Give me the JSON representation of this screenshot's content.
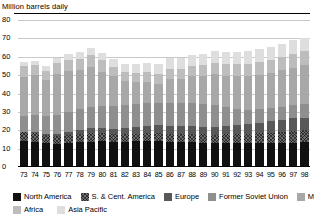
{
  "chart_data": {
    "type": "bar",
    "stacked": true,
    "title": "Million barrels daily",
    "xlabel": "",
    "ylabel": "Million barrels daily",
    "ylim": [
      0,
      80
    ],
    "yticks": [
      0,
      10,
      20,
      30,
      40,
      50,
      60,
      70,
      80
    ],
    "grid": true,
    "legend_position": "bottom",
    "categories": [
      "73",
      "74",
      "75",
      "76",
      "77",
      "78",
      "79",
      "80",
      "81",
      "82",
      "83",
      "84",
      "85",
      "86",
      "87",
      "88",
      "89",
      "90",
      "91",
      "92",
      "93",
      "94",
      "95",
      "96",
      "97",
      "98"
    ],
    "series": [
      {
        "name": "North America",
        "color": "#111111",
        "values": [
          13.9,
          13.5,
          13.0,
          12.6,
          13.1,
          13.6,
          13.8,
          13.9,
          13.7,
          13.8,
          14.0,
          14.3,
          14.2,
          13.8,
          13.6,
          13.5,
          13.3,
          13.0,
          13.0,
          12.9,
          12.9,
          12.9,
          12.8,
          13.0,
          13.3,
          13.4
        ]
      },
      {
        "name": "S. & Cent. America",
        "color": "#6e6e6e",
        "values": [
          5.0,
          4.9,
          4.3,
          4.3,
          4.4,
          4.4,
          4.7,
          4.5,
          4.3,
          4.2,
          4.2,
          4.3,
          4.3,
          4.4,
          4.4,
          4.5,
          4.6,
          4.7,
          4.9,
          5.1,
          5.2,
          5.5,
          5.8,
          6.1,
          6.5,
          6.8
        ]
      },
      {
        "name": "Europe",
        "color": "#585858",
        "values": [
          0.4,
          0.5,
          0.6,
          1.0,
          1.7,
          2.2,
          2.5,
          2.6,
          2.9,
          3.2,
          3.7,
          4.0,
          4.2,
          4.4,
          4.4,
          4.2,
          4.1,
          4.3,
          4.5,
          4.8,
          5.2,
          5.8,
          6.2,
          6.6,
          6.7,
          6.6
        ]
      },
      {
        "name": "Former Soviet Union",
        "color": "#8f8f8f",
        "values": [
          8.6,
          9.2,
          9.8,
          10.4,
          10.9,
          11.4,
          11.7,
          12.1,
          12.2,
          12.3,
          12.3,
          12.1,
          11.9,
          12.3,
          12.5,
          12.5,
          12.1,
          11.5,
          10.4,
          8.9,
          8.0,
          7.2,
          7.1,
          7.1,
          7.2,
          7.3
        ]
      },
      {
        "name": "Middle East",
        "color": "#a8a8a8",
        "values": [
          21.2,
          21.8,
          19.6,
          22.3,
          22.2,
          21.2,
          21.8,
          18.9,
          16.3,
          13.3,
          12.0,
          11.7,
          10.7,
          13.0,
          13.2,
          14.6,
          15.4,
          17.0,
          16.9,
          17.7,
          18.4,
          18.9,
          19.2,
          19.8,
          20.3,
          21.4
        ]
      },
      {
        "name": "Africa",
        "color": "#bdbdbd",
        "values": [
          5.8,
          5.4,
          5.0,
          6.1,
          6.2,
          6.1,
          6.7,
          6.2,
          5.0,
          4.9,
          4.9,
          5.1,
          5.3,
          5.4,
          5.4,
          5.7,
          6.0,
          6.2,
          6.3,
          6.5,
          6.6,
          6.7,
          6.9,
          7.2,
          7.5,
          7.5
        ]
      },
      {
        "name": "Asia Pacific",
        "color": "#dedede",
        "values": [
          2.1,
          2.4,
          2.6,
          2.9,
          3.3,
          3.5,
          3.7,
          4.0,
          4.3,
          4.6,
          4.9,
          5.3,
          5.6,
          5.8,
          5.9,
          6.1,
          6.3,
          6.6,
          6.7,
          6.8,
          6.9,
          7.0,
          7.1,
          7.4,
          7.5,
          7.4
        ]
      }
    ]
  },
  "legend": {
    "items": [
      {
        "label": "North America",
        "swatch": "s-na"
      },
      {
        "label": "S. & Cent. America",
        "swatch": "s-sca"
      },
      {
        "label": "Europe",
        "swatch": "s-eu"
      },
      {
        "label": "Former Soviet Union",
        "swatch": "s-fsu"
      },
      {
        "label": "Middle East",
        "swatch": "s-me"
      },
      {
        "label": "Africa",
        "swatch": "s-af"
      },
      {
        "label": "Asia Pacific",
        "swatch": "s-ap"
      }
    ]
  }
}
